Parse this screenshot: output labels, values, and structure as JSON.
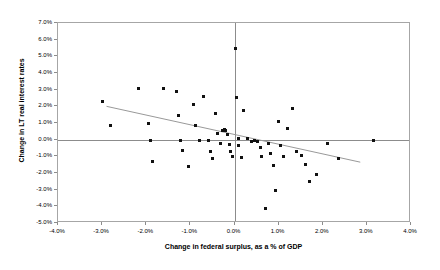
{
  "chart_data": {
    "type": "scatter",
    "title": "",
    "xlabel": "Change in federal surplus, as a % of GDP",
    "ylabel": "Change in LT real interest rates",
    "xlim": [
      -4.0,
      4.0
    ],
    "ylim": [
      -5.0,
      7.0
    ],
    "xticks": [
      "-4.0%",
      "-3.0%",
      "-2.0%",
      "-1.0%",
      "0.0%",
      "1.0%",
      "2.0%",
      "3.0%",
      "4.0%"
    ],
    "xtick_values": [
      -4.0,
      -3.0,
      -2.0,
      -1.0,
      0.0,
      1.0,
      2.0,
      3.0,
      4.0
    ],
    "yticks": [
      "-5.0%",
      "-4.0%",
      "-3.0%",
      "-2.0%",
      "-1.0%",
      "0.0%",
      "1.0%",
      "2.0%",
      "3.0%",
      "4.0%",
      "5.0%",
      "6.0%",
      "7.0%"
    ],
    "ytick_values": [
      -5.0,
      -4.0,
      -3.0,
      -2.0,
      -1.0,
      0.0,
      1.0,
      2.0,
      3.0,
      4.0,
      5.0,
      6.0,
      7.0
    ],
    "grid": false,
    "legend": "none",
    "zero_lines": {
      "x": 0.0,
      "y": 0.0
    },
    "marker_color": "#111111",
    "frame_color": "#a6a6a6",
    "axis_color": "#8c8c8c",
    "trendline": {
      "label": "linear fit",
      "color": "#999999",
      "x0": -2.9,
      "y0": 2.0,
      "x1": 2.85,
      "y1": -1.35
    },
    "points": [
      {
        "x": -3.0,
        "y": 2.3
      },
      {
        "x": -2.82,
        "y": 0.85
      },
      {
        "x": -2.18,
        "y": 3.05
      },
      {
        "x": -1.95,
        "y": 0.95
      },
      {
        "x": -1.9,
        "y": -0.05
      },
      {
        "x": -1.85,
        "y": -1.3
      },
      {
        "x": -1.62,
        "y": 3.1
      },
      {
        "x": -1.32,
        "y": 2.9
      },
      {
        "x": -1.28,
        "y": 1.45
      },
      {
        "x": -1.22,
        "y": -0.05
      },
      {
        "x": -1.18,
        "y": -0.65
      },
      {
        "x": -1.05,
        "y": -1.6
      },
      {
        "x": -0.92,
        "y": 2.1
      },
      {
        "x": -0.88,
        "y": 0.85
      },
      {
        "x": -0.8,
        "y": -0.05
      },
      {
        "x": -0.7,
        "y": 2.6
      },
      {
        "x": -0.58,
        "y": -0.05
      },
      {
        "x": -0.55,
        "y": -0.7
      },
      {
        "x": -0.5,
        "y": -1.1
      },
      {
        "x": -0.42,
        "y": 1.55
      },
      {
        "x": -0.38,
        "y": 0.4
      },
      {
        "x": -0.32,
        "y": -0.25
      },
      {
        "x": -0.28,
        "y": 0.55
      },
      {
        "x": -0.22,
        "y": 0.6
      },
      {
        "x": -0.2,
        "y": 0.55
      },
      {
        "x": -0.15,
        "y": 0.3
      },
      {
        "x": -0.12,
        "y": -0.3
      },
      {
        "x": -0.08,
        "y": -0.7
      },
      {
        "x": -0.05,
        "y": -1.0
      },
      {
        "x": 0.02,
        "y": 5.5
      },
      {
        "x": 0.05,
        "y": 2.55
      },
      {
        "x": 0.08,
        "y": 0.05
      },
      {
        "x": 0.1,
        "y": -0.35
      },
      {
        "x": 0.15,
        "y": -1.05
      },
      {
        "x": 0.2,
        "y": 1.75
      },
      {
        "x": 0.3,
        "y": 0.05
      },
      {
        "x": 0.38,
        "y": -0.1
      },
      {
        "x": 0.45,
        "y": -0.05
      },
      {
        "x": 0.52,
        "y": -0.08
      },
      {
        "x": 0.58,
        "y": -0.45
      },
      {
        "x": 0.62,
        "y": -1.0
      },
      {
        "x": 0.7,
        "y": -4.1
      },
      {
        "x": 0.78,
        "y": -0.25
      },
      {
        "x": 0.82,
        "y": -0.8
      },
      {
        "x": 0.88,
        "y": -1.55
      },
      {
        "x": 0.92,
        "y": -3.05
      },
      {
        "x": 1.0,
        "y": 1.1
      },
      {
        "x": 1.05,
        "y": -0.35
      },
      {
        "x": 1.12,
        "y": -1.0
      },
      {
        "x": 1.2,
        "y": 0.7
      },
      {
        "x": 1.32,
        "y": 1.85
      },
      {
        "x": 1.4,
        "y": -0.7
      },
      {
        "x": 1.52,
        "y": -0.95
      },
      {
        "x": 1.62,
        "y": -1.5
      },
      {
        "x": 1.7,
        "y": -2.5
      },
      {
        "x": 1.85,
        "y": -2.1
      },
      {
        "x": 2.1,
        "y": -0.25
      },
      {
        "x": 2.35,
        "y": -1.1
      },
      {
        "x": 3.15,
        "y": -0.05
      }
    ]
  }
}
